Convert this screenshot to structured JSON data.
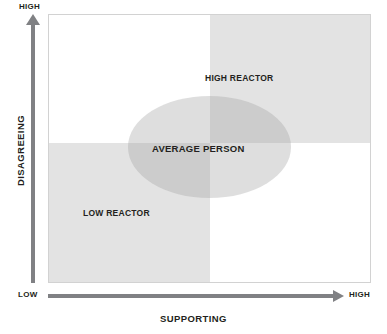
{
  "chart_data": {
    "type": "scatter",
    "title": "",
    "xlabel": "SUPPORTING",
    "ylabel": "DISAGREEING",
    "x_axis": {
      "label": "SUPPORTING",
      "low_label": "LOW",
      "high_label": "HIGH",
      "arrow_direction": "right"
    },
    "y_axis": {
      "label": "DISAGREEING",
      "high_label": "HIGH",
      "arrow_direction": "up"
    },
    "grid": false,
    "legend": "none",
    "quadrants": [
      {
        "name": "high-reactor",
        "label": "HIGH REACTOR",
        "position": "top-right",
        "shaded": true,
        "shade_color": "#e3e3e3"
      },
      {
        "name": "low-reactor",
        "label": "LOW REACTOR",
        "position": "bottom-left",
        "shaded": true,
        "shade_color": "#e3e3e3"
      },
      {
        "name": "top-left",
        "label": "",
        "position": "top-left",
        "shaded": false,
        "shade_color": "#ffffff"
      },
      {
        "name": "bottom-right",
        "label": "",
        "position": "bottom-right",
        "shaded": false,
        "shade_color": "#ffffff"
      }
    ],
    "annotations": [
      {
        "name": "average-person",
        "label": "AVERAGE PERSON",
        "shape": "ellipse",
        "center_x": "mid",
        "center_y": "mid",
        "fill": "#a0a0a0"
      }
    ],
    "colors": {
      "shade": "#e3e3e3",
      "ellipse": "#a0a0a0",
      "axis": "#808184",
      "frame": "#d2d2d2",
      "text": "#231f20",
      "background": "#ffffff"
    }
  },
  "diagram": {
    "axes": {
      "y": {
        "title": "DISAGREEING",
        "high": "HIGH"
      },
      "x": {
        "title": "SUPPORTING",
        "low": "LOW",
        "high": "HIGH"
      }
    },
    "quadrant_labels": {
      "high_reactor": "HIGH REACTOR",
      "low_reactor": "LOW REACTOR"
    },
    "center_label": "AVERAGE PERSON"
  }
}
